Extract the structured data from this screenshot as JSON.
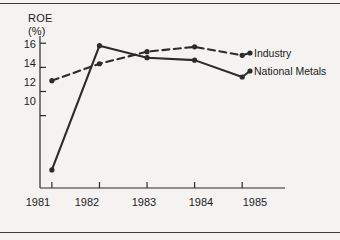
{
  "chart_data": {
    "type": "line",
    "title": "",
    "ylabel_line1": "ROE",
    "ylabel_line2": "(%)",
    "xlabel": "",
    "categories": [
      "1981",
      "1982",
      "1983",
      "1984",
      "1985"
    ],
    "x": [
      1981,
      1982,
      1983,
      1984,
      1985
    ],
    "ylim": [
      4.0,
      16.6
    ],
    "xlim": [
      1980.75,
      1985.9
    ],
    "yticks": [
      10,
      12,
      14,
      16
    ],
    "ytick_labels": [
      "10",
      "12",
      "14",
      "16"
    ],
    "xticks": [
      1981,
      1982,
      1983,
      1984,
      1985
    ],
    "xtick_labels": [
      "1981",
      "1982",
      "1983",
      "1984",
      "1985"
    ],
    "grid": false,
    "legend_position": "right-inline-labels",
    "series": [
      {
        "name": "Industry",
        "label": "Industry",
        "style": "dashed",
        "marker": "dot",
        "color": "#2b2b2b",
        "values": [
          12.9,
          14.3,
          15.3,
          15.7,
          15.0
        ]
      },
      {
        "name": "National Metals",
        "label": "National Metals",
        "style": "solid",
        "marker": "dot",
        "color": "#2b2b2b",
        "values": [
          5.5,
          15.8,
          14.8,
          14.6,
          13.2
        ]
      }
    ]
  },
  "figure": {
    "background": "#f4f3f1",
    "ink": "#2b2b2b",
    "rule_color": "#3a3a3a"
  }
}
